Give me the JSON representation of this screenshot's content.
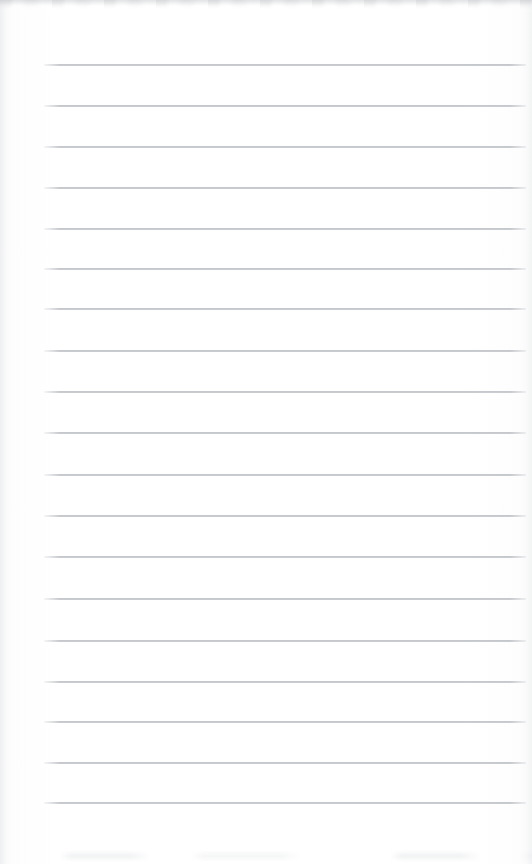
{
  "page": {
    "kind": "scanned-blank-lined-paper",
    "width": 532,
    "height": 864,
    "paper_color": "#fefefe",
    "has_written_content": false,
    "text_content": ""
  },
  "ruling": {
    "line_color": "#b2b6bb",
    "line_count": 19,
    "first_line_y": 64,
    "line_spacing": 41,
    "line_thickness": 2,
    "left_margin_x": 44,
    "right_edge_x": 526,
    "lines": [
      {
        "y": 64,
        "x_start": 44,
        "x_end": 526
      },
      {
        "y": 105,
        "x_start": 44,
        "x_end": 526
      },
      {
        "y": 146,
        "x_start": 44,
        "x_end": 526
      },
      {
        "y": 187,
        "x_start": 44,
        "x_end": 526
      },
      {
        "y": 228,
        "x_start": 44,
        "x_end": 526
      },
      {
        "y": 268,
        "x_start": 44,
        "x_end": 526
      },
      {
        "y": 308,
        "x_start": 44,
        "x_end": 526
      },
      {
        "y": 350,
        "x_start": 44,
        "x_end": 526
      },
      {
        "y": 391,
        "x_start": 44,
        "x_end": 526
      },
      {
        "y": 432,
        "x_start": 44,
        "x_end": 526
      },
      {
        "y": 474,
        "x_start": 44,
        "x_end": 526
      },
      {
        "y": 515,
        "x_start": 44,
        "x_end": 526
      },
      {
        "y": 556,
        "x_start": 44,
        "x_end": 526
      },
      {
        "y": 598,
        "x_start": 44,
        "x_end": 526
      },
      {
        "y": 640,
        "x_start": 44,
        "x_end": 526
      },
      {
        "y": 681,
        "x_start": 44,
        "x_end": 526
      },
      {
        "y": 721,
        "x_start": 44,
        "x_end": 526
      },
      {
        "y": 762,
        "x_start": 44,
        "x_end": 526
      },
      {
        "y": 802,
        "x_start": 44,
        "x_end": 526
      }
    ]
  },
  "scan_artifacts": {
    "top_edge": {
      "y": 0,
      "height": 7,
      "color": "#c4c6c9"
    },
    "bottom_smudge": {
      "y": 850,
      "height": 12,
      "color": "#dee0e3"
    },
    "left_shadow": {
      "x": 0,
      "width": 14,
      "color": "#ecedef"
    },
    "right_shadow": {
      "x": 520,
      "width": 12,
      "color": "#f0f1f2"
    }
  }
}
